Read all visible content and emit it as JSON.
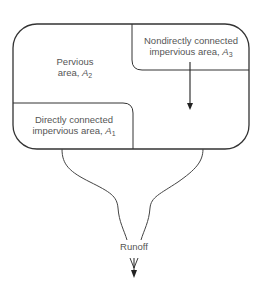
{
  "diagram": {
    "regions": {
      "pervious": {
        "line1": "Pervious",
        "line2_prefix": "area, ",
        "symbol": "A",
        "subscript": "2"
      },
      "nondirect": {
        "line1": "Nondirectly connected",
        "line2_prefix": "impervious area, ",
        "symbol": "A",
        "subscript": "3"
      },
      "direct": {
        "line1": "Directly connected",
        "line2_prefix": "impervious area, ",
        "symbol": "A",
        "subscript": "1"
      }
    },
    "outlet": {
      "label": "Runoff"
    },
    "colors": {
      "stroke": "#333333",
      "text": "#555555",
      "background": "#ffffff"
    }
  }
}
